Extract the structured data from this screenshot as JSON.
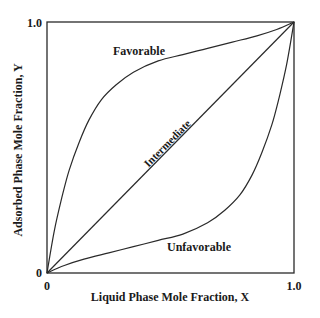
{
  "chart_data": {
    "type": "line",
    "title": "",
    "xlabel": "Liquid Phase Mole Fraction, X",
    "ylabel": "Adsorbed Phase Mole Fraction, Y",
    "xlim": [
      0,
      1.0
    ],
    "ylim": [
      0,
      1.0
    ],
    "x_ticks": [
      "0",
      "1.0"
    ],
    "y_ticks": [
      "0",
      "1.0"
    ],
    "grid": false,
    "legend": "none (inline curve labels)",
    "series": [
      {
        "name": "Favorable",
        "x": [
          0,
          0.03,
          0.06,
          0.09,
          0.13,
          0.17,
          0.22,
          0.28,
          0.35,
          0.45,
          0.55,
          0.65,
          0.75,
          0.85,
          0.93,
          1.0
        ],
        "y": [
          0,
          0.17,
          0.3,
          0.41,
          0.52,
          0.61,
          0.69,
          0.75,
          0.8,
          0.845,
          0.87,
          0.895,
          0.92,
          0.945,
          0.97,
          1.0
        ]
      },
      {
        "name": "Intermediate",
        "x": [
          0,
          1.0
        ],
        "y": [
          0,
          1.0
        ]
      },
      {
        "name": "Unfavorable",
        "x": [
          0,
          0.07,
          0.15,
          0.25,
          0.35,
          0.45,
          0.55,
          0.65,
          0.72,
          0.78,
          0.83,
          0.87,
          0.91,
          0.94,
          0.97,
          1.0
        ],
        "y": [
          0,
          0.03,
          0.055,
          0.08,
          0.105,
          0.13,
          0.155,
          0.2,
          0.25,
          0.31,
          0.39,
          0.48,
          0.59,
          0.7,
          0.83,
          1.0
        ]
      }
    ],
    "annotations": [
      {
        "text": "Favorable",
        "x": 0.33,
        "y": 0.88
      },
      {
        "text": "Intermediate",
        "x": 0.5,
        "y": 0.52,
        "rotation": -45
      },
      {
        "text": "Unfavorable",
        "x": 0.63,
        "y": 0.1
      }
    ]
  },
  "labels": {
    "xlabel": "Liquid Phase Mole Fraction, X",
    "ylabel": "Adsorbed Phase Mole Fraction, Y",
    "x_tick_min": "0",
    "x_tick_max": "1.0",
    "y_tick_min": "0",
    "y_tick_max": "1.0",
    "curve_favorable": "Favorable",
    "curve_intermediate": "Intermediate",
    "curve_unfavorable": "Unfavorable"
  },
  "colors": {
    "line": "#2a2a2a",
    "text": "#1a1a1a",
    "background": "#ffffff"
  }
}
